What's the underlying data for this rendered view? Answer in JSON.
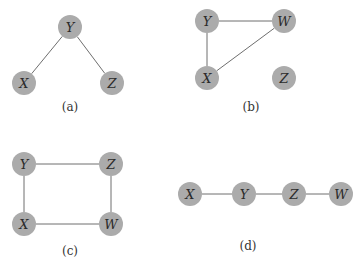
{
  "diagram": {
    "node_color": "#ababab",
    "edge_color": "#6e6e6e",
    "node_radius": 12,
    "panels": [
      {
        "id": "a",
        "caption": "(a)",
        "caption_pos": [
          70,
          111
        ],
        "nodes": [
          {
            "id": "Y",
            "label": "Y",
            "x": 70,
            "y": 27
          },
          {
            "id": "X",
            "label": "X",
            "x": 24,
            "y": 83
          },
          {
            "id": "Z",
            "label": "Z",
            "x": 112,
            "y": 83
          }
        ],
        "edges": [
          [
            "Y",
            "X"
          ],
          [
            "Y",
            "Z"
          ]
        ]
      },
      {
        "id": "b",
        "caption": "(b)",
        "caption_pos": [
          251,
          111
        ],
        "nodes": [
          {
            "id": "Y",
            "label": "Y",
            "x": 207,
            "y": 21
          },
          {
            "id": "W",
            "label": "W",
            "x": 284,
            "y": 21
          },
          {
            "id": "X",
            "label": "X",
            "x": 207,
            "y": 78
          },
          {
            "id": "Z",
            "label": "Z",
            "x": 284,
            "y": 78
          }
        ],
        "edges": [
          [
            "Y",
            "W"
          ],
          [
            "Y",
            "X"
          ],
          [
            "X",
            "W"
          ]
        ]
      },
      {
        "id": "c",
        "caption": "(c)",
        "caption_pos": [
          70,
          255
        ],
        "nodes": [
          {
            "id": "Y",
            "label": "Y",
            "x": 24,
            "y": 164
          },
          {
            "id": "Z",
            "label": "Z",
            "x": 111,
            "y": 164
          },
          {
            "id": "X",
            "label": "X",
            "x": 24,
            "y": 224
          },
          {
            "id": "W",
            "label": "W",
            "x": 111,
            "y": 224
          }
        ],
        "edges": [
          [
            "Y",
            "Z"
          ],
          [
            "Y",
            "X"
          ],
          [
            "Z",
            "W"
          ],
          [
            "X",
            "W"
          ]
        ]
      },
      {
        "id": "d",
        "caption": "(d)",
        "caption_pos": [
          248,
          250
        ],
        "nodes": [
          {
            "id": "X",
            "label": "X",
            "x": 190,
            "y": 194
          },
          {
            "id": "Y",
            "label": "Y",
            "x": 244,
            "y": 194
          },
          {
            "id": "Z",
            "label": "Z",
            "x": 294,
            "y": 194
          },
          {
            "id": "W",
            "label": "W",
            "x": 341,
            "y": 194
          }
        ],
        "edges": [
          [
            "X",
            "Y"
          ],
          [
            "Y",
            "Z"
          ],
          [
            "Z",
            "W"
          ]
        ]
      }
    ]
  }
}
